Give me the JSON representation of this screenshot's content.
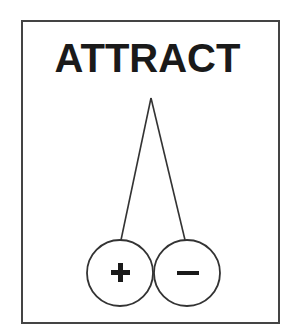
{
  "diagram": {
    "title": "ATTRACT",
    "charges": [
      {
        "name": "positive",
        "symbol": "+"
      },
      {
        "name": "negative",
        "symbol": "−"
      }
    ],
    "colors": {
      "stroke": "#333333",
      "text": "#1a1a1a",
      "background": "#ffffff"
    }
  }
}
